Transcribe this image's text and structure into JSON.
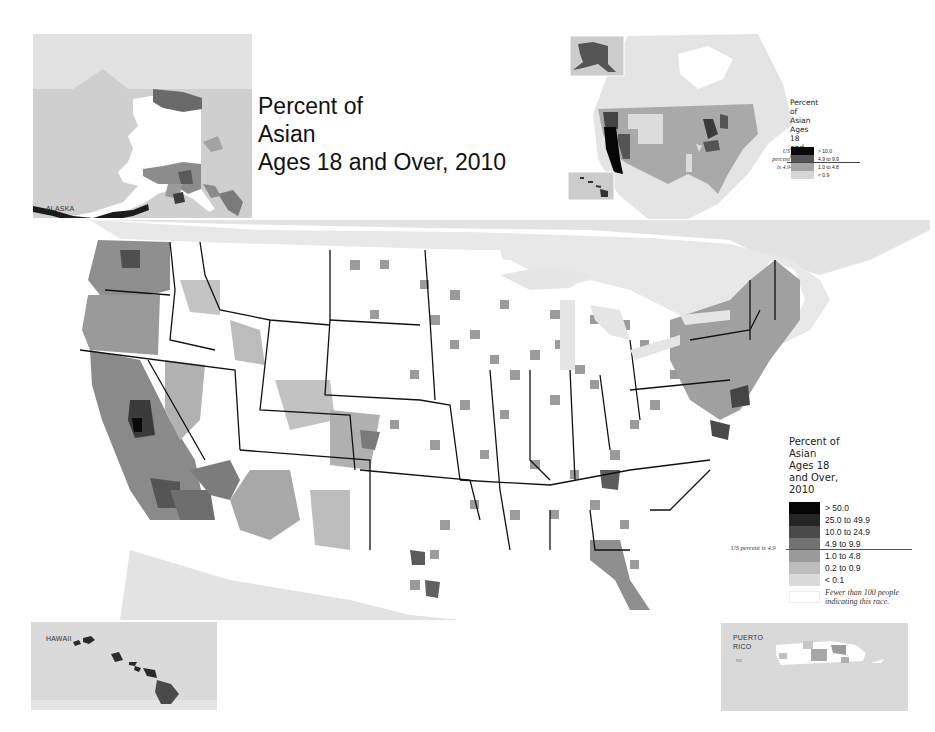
{
  "main_title": {
    "lines": [
      "Percent of",
      "Asian",
      "Ages 18 and Over, 2010"
    ]
  },
  "insets": {
    "alaska": {
      "label": "ALASKA"
    },
    "hawaii": {
      "label": "HAWAII"
    },
    "puerto_rico": {
      "label_line1": "PUERTO",
      "label_line2": "RICO"
    }
  },
  "state_map": {
    "legend": {
      "title_lines": [
        "Percent of",
        "Asian",
        "Ages 18",
        "and Over,",
        "2010"
      ],
      "us_note_lines": [
        "US",
        "percent",
        "is 4.9"
      ],
      "classes": [
        {
          "label": "> 10.0",
          "color": "#0a0a0a"
        },
        {
          "label": "4.9 to 9.9",
          "color": "#555555"
        },
        {
          "label": "1.0 to 4.8",
          "color": "#a5a5a5"
        },
        {
          "label": "< 0.9",
          "color": "#d6d6d6"
        }
      ]
    }
  },
  "county_map": {
    "legend": {
      "title_lines": [
        "Percent of",
        "Asian",
        "Ages 18",
        "and Over,",
        "2010"
      ],
      "us_note": "US percent is 4.9",
      "classes": [
        {
          "label": "> 50.0",
          "color": "#050505"
        },
        {
          "label": "25.0 to 49.9",
          "color": "#262626"
        },
        {
          "label": "10.0 to 24.9",
          "color": "#4a4a4a"
        },
        {
          "label": "4.9 to 9.9",
          "color": "#727272"
        },
        {
          "label": "1.0 to 4.8",
          "color": "#9a9a9a"
        },
        {
          "label": "0.2 to 0.9",
          "color": "#bdbdbd"
        },
        {
          "label": "< 0.1",
          "color": "#dadada"
        }
      ],
      "no_data": {
        "label_line1": "Fewer than 100 people",
        "label_line2": "indicating this race.",
        "color": "#ffffff"
      }
    }
  },
  "colors": {
    "water": "#ffffff",
    "land_outside": "#dedede",
    "inset_bg": "#d9d9d9",
    "state_border": "#111111"
  }
}
